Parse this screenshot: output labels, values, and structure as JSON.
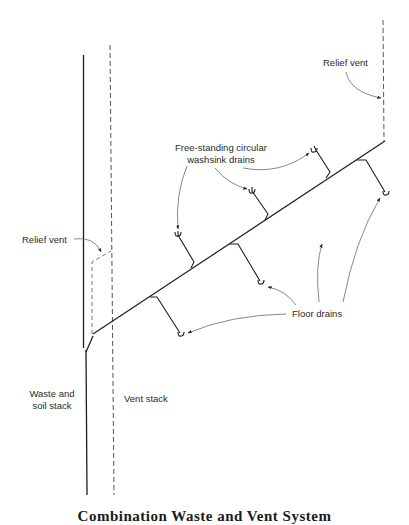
{
  "labels": {
    "relief_vent_top": "Relief vent",
    "washsink_line1": "Free-standing circular",
    "washsink_line2": "washsink drains",
    "relief_vent_left": "Relief vent",
    "floor_drains": "Floor drains",
    "waste_line1": "Waste and",
    "waste_line2": "soil stack",
    "vent_stack": "Vent stack"
  },
  "caption": "Combination Waste and Vent System",
  "colors": {
    "line": "#1e1e1e",
    "dashed": "#555555",
    "leader": "#6a6a6a",
    "text": "#2a2a2a"
  }
}
